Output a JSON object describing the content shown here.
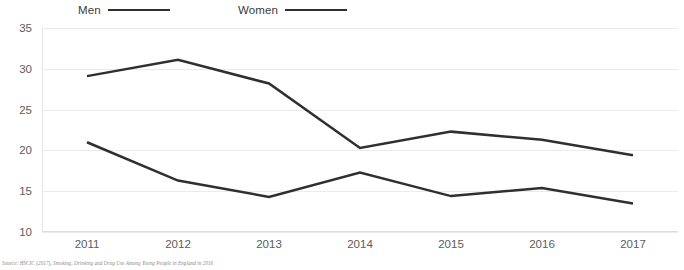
{
  "legend": {
    "position": "top",
    "entries": [
      {
        "label": "Men",
        "color": "#2f2f2f"
      },
      {
        "label": "Women",
        "color": "#2f2f2f"
      }
    ]
  },
  "source_note": "Source: HSCIC (2017), Smoking, Drinking and Drug Use Among Young People in England in 2016",
  "axis": {
    "y_ticks": [
      "35",
      "30",
      "25",
      "20",
      "15",
      "10"
    ],
    "x_ticks": [
      "2011",
      "2012",
      "2013",
      "2014",
      "2015",
      "2016",
      "2017"
    ]
  },
  "chart_data": {
    "type": "line",
    "title": "",
    "xlabel": "",
    "ylabel": "",
    "categories": [
      "2011",
      "2012",
      "2013",
      "2014",
      "2015",
      "2016",
      "2017"
    ],
    "x": [
      2011,
      2012,
      2013,
      2014,
      2015,
      2016,
      2017
    ],
    "series": [
      {
        "name": "Men",
        "color": "#2f2f2f",
        "values": [
          29.1,
          31.1,
          28.2,
          20.3,
          22.3,
          21.3,
          19.4
        ]
      },
      {
        "name": "Women",
        "color": "#2f2f2f",
        "values": [
          21.0,
          16.3,
          14.3,
          17.3,
          14.4,
          15.4,
          13.5
        ]
      }
    ],
    "ylim": [
      10,
      35
    ],
    "yticks": [
      10,
      15,
      20,
      25,
      30,
      35
    ],
    "grid": true,
    "legend_position": "top"
  }
}
